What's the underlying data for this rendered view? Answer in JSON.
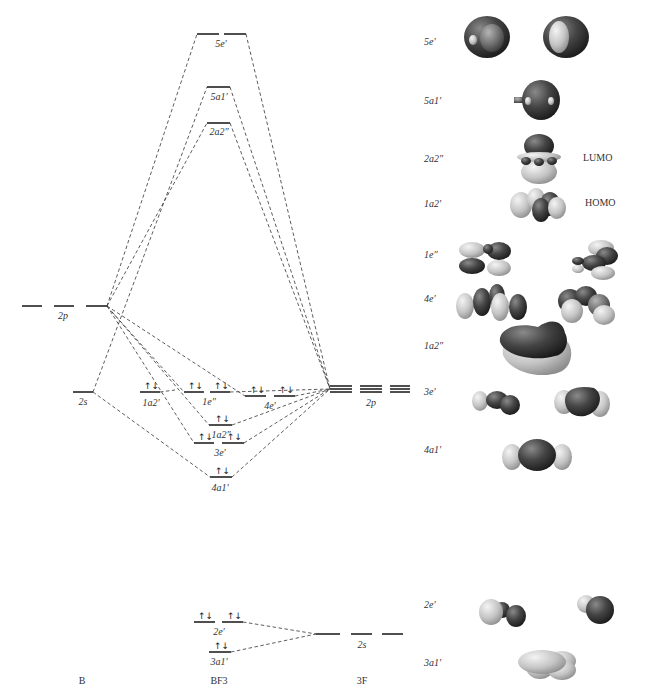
{
  "diagram": {
    "columns": {
      "left": "B",
      "center": "BF3",
      "center_sub": "3",
      "right": "3F"
    },
    "boron_levels": [
      {
        "name": "2p",
        "label": "2p",
        "degeneracy": 3
      },
      {
        "name": "2s",
        "label": "2s",
        "degeneracy": 1
      }
    ],
    "fluorine_levels": [
      {
        "name": "2p",
        "label": "2p",
        "degeneracy": 9
      },
      {
        "name": "2s",
        "label": "2s",
        "degeneracy": 3
      }
    ],
    "mo_levels": [
      {
        "label": "5e′",
        "occupancy": "empty"
      },
      {
        "label": "5a1′",
        "occupancy": "empty"
      },
      {
        "label": "2a2″",
        "occupancy": "empty"
      },
      {
        "label": "1a2′",
        "occupancy": "↑↓"
      },
      {
        "label": "1e″",
        "occupancy": "↑↓ ↑↓"
      },
      {
        "label": "4e′",
        "occupancy": "↑↓ ↑↓"
      },
      {
        "label": "1a2″",
        "occupancy": "↑↓"
      },
      {
        "label": "3e′",
        "occupancy": "↑↓ ↑↓"
      },
      {
        "label": "4a1′",
        "occupancy": "↑↓"
      },
      {
        "label": "2e′",
        "occupancy": "↑↓ ↑↓"
      },
      {
        "label": "3a1′",
        "occupancy": "↑↓"
      }
    ],
    "spin_pair": "↑↓"
  },
  "orbital_pictures": [
    {
      "label": "5e′",
      "tag": ""
    },
    {
      "label": "5a1′",
      "tag": ""
    },
    {
      "label": "2a2″",
      "tag": "LUMO"
    },
    {
      "label": "1a2′",
      "tag": "HOMO"
    },
    {
      "label": "1e″",
      "tag": ""
    },
    {
      "label": "4e′",
      "tag": ""
    },
    {
      "label": "1a2″",
      "tag": ""
    },
    {
      "label": "3e′",
      "tag": ""
    },
    {
      "label": "4a1′",
      "tag": ""
    },
    {
      "label": "2e′",
      "tag": ""
    },
    {
      "label": "3a1′",
      "tag": ""
    }
  ],
  "colors": {
    "line": "#222222",
    "lobe_dark": "#3a3a3a",
    "lobe_light": "#cfcfcf",
    "background": "#ffffff"
  }
}
